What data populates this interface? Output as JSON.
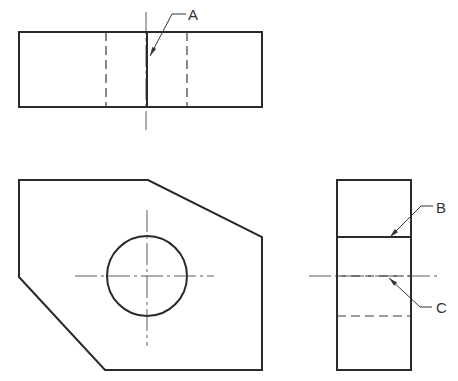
{
  "drawing": {
    "type": "orthographic-projection",
    "views": {
      "top": {
        "outline": {
          "x": 19,
          "y": 32,
          "w": 243,
          "h": 75
        },
        "hidden_lines": [
          {
            "x1": 106,
            "y1": 32,
            "x2": 106,
            "y2": 107
          },
          {
            "x1": 187,
            "y1": 32,
            "x2": 187,
            "y2": 107
          }
        ],
        "visible_lines": [
          {
            "x1": 147,
            "y1": 32,
            "x2": 147,
            "y2": 107
          }
        ],
        "center_lines": [
          {
            "x1": 146,
            "y1": 12,
            "x2": 146,
            "y2": 130
          }
        ]
      },
      "front": {
        "outline_points": "19,180 148,180 262,237 262,370 105,370 19,277",
        "circle": {
          "cx": 147,
          "cy": 276,
          "r": 40
        },
        "center_lines": [
          {
            "x1": 147,
            "y1": 210,
            "x2": 147,
            "y2": 346
          },
          {
            "x1": 75,
            "y1": 276,
            "x2": 214,
            "y2": 276
          }
        ]
      },
      "side": {
        "outline": {
          "x": 337,
          "y": 180,
          "w": 74,
          "h": 190
        },
        "visible_lines": [
          {
            "x1": 337,
            "y1": 237,
            "x2": 411,
            "y2": 237
          }
        ],
        "hidden_lines": [
          {
            "x1": 337,
            "y1": 276,
            "x2": 411,
            "y2": 276
          },
          {
            "x1": 337,
            "y1": 316,
            "x2": 411,
            "y2": 316
          }
        ],
        "center_lines": [
          {
            "x1": 309,
            "y1": 276,
            "x2": 437,
            "y2": 276
          }
        ]
      }
    },
    "callouts": [
      {
        "label": "A",
        "points": "150,56 172,14 186,14",
        "tip": {
          "x": 150,
          "y": 56,
          "angle": 117
        },
        "text_x": 188,
        "text_y": 20
      },
      {
        "label": "B",
        "points": "390,237 421,206 433,206",
        "tip": {
          "x": 390,
          "y": 237,
          "angle": 135
        },
        "text_x": 436,
        "text_y": 213
      },
      {
        "label": "C",
        "points": "389,278 420,307 432,307",
        "tip": {
          "x": 389,
          "y": 278,
          "angle": 223
        },
        "text_x": 436,
        "text_y": 313
      }
    ]
  }
}
